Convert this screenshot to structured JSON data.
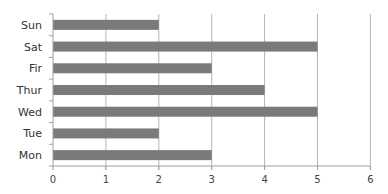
{
  "chart_data": {
    "type": "bar",
    "orientation": "horizontal",
    "title": "",
    "xlabel": "",
    "ylabel": "",
    "categories": [
      "Sun",
      "Sat",
      "Fir",
      "Thur",
      "Wed",
      "Tue",
      "Mon"
    ],
    "values": [
      2,
      5,
      3,
      4,
      5,
      2,
      3
    ],
    "xlim": [
      0,
      6
    ],
    "xticks": [
      "0",
      "1",
      "2",
      "3",
      "4",
      "5",
      "6"
    ],
    "grid": "vertical",
    "legend": "none",
    "bar_color": "#7a7a7a",
    "grid_color": "#b5b5b5",
    "axis_color": "#a0a0a0"
  }
}
